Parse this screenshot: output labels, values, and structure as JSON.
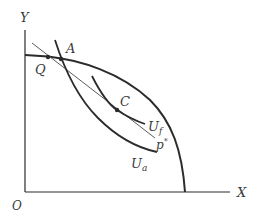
{
  "diagram": {
    "type": "production-possibility-frontier",
    "axes": {
      "x_label": "X",
      "y_label": "Y",
      "origin_label": "O"
    },
    "points": [
      {
        "id": "A",
        "label": "A"
      },
      {
        "id": "Q",
        "label": "Q"
      },
      {
        "id": "C",
        "label": "C"
      }
    ],
    "curves": [
      {
        "id": "ppf",
        "label": ""
      },
      {
        "id": "price_line",
        "label": "p",
        "label_sup": "*"
      },
      {
        "id": "u_f",
        "label": "U",
        "label_sub": "f"
      },
      {
        "id": "u_a",
        "label": "U",
        "label_sub": "a"
      }
    ],
    "colors": {
      "line": "#2b2b2b",
      "thin_line": "#5a5a5a",
      "text": "#3a3a3a"
    }
  }
}
